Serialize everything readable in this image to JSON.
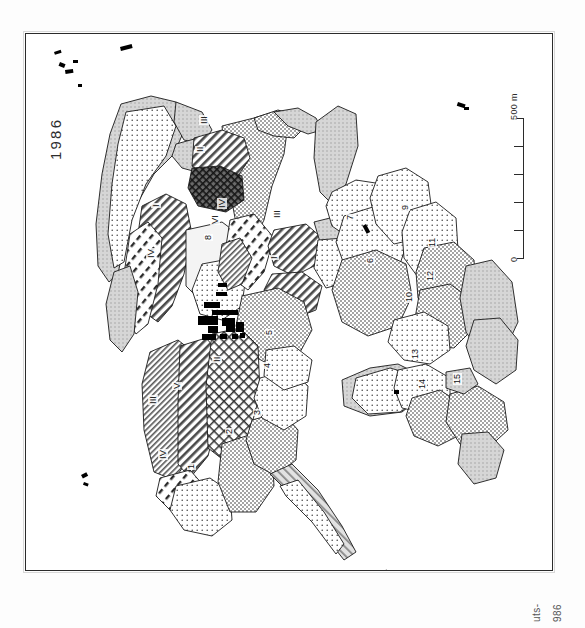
{
  "figure": {
    "year_label": "1986",
    "caption_fragment_1": "uts-",
    "caption_fragment_2": "986",
    "orientation": "rotated-90"
  },
  "scale_bar": {
    "max_label": "500 m",
    "min_label": "0",
    "segments": 5,
    "unit": "m",
    "max_value": 500,
    "min_value": 0
  },
  "colors": {
    "ink": "#111111",
    "frame": "#2b2b2b",
    "paper": "#ffffff",
    "light_tone": "#e9e9e9",
    "mid_tone": "#c9c9c9",
    "dark_tone": "#6f6f6f",
    "building_fill": "#000000"
  },
  "map": {
    "roman_parcels": [
      {
        "label": "III",
        "x": 198,
        "y": 124,
        "pattern": "diagonal-hatch"
      },
      {
        "label": "II",
        "x": 194,
        "y": 152,
        "pattern": "dark-crosshatch"
      },
      {
        "label": "I",
        "x": 150,
        "y": 207,
        "pattern": "diagonal-hatch"
      },
      {
        "label": "IV",
        "x": 145,
        "y": 258,
        "pattern": "dash-hatch"
      },
      {
        "label": "IV",
        "x": 216,
        "y": 208,
        "pattern": "dash-hatch"
      },
      {
        "label": "VI",
        "x": 209,
        "y": 224,
        "pattern": "dash-hatch"
      },
      {
        "label": "III",
        "x": 271,
        "y": 218,
        "pattern": "diagonal-hatch"
      },
      {
        "label": "I",
        "x": 268,
        "y": 259,
        "pattern": "diagonal-hatch"
      },
      {
        "label": "III",
        "x": 147,
        "y": 404,
        "pattern": "diagonal-hatch"
      },
      {
        "label": "V",
        "x": 171,
        "y": 389,
        "pattern": "diagonal-hatch"
      },
      {
        "label": "II",
        "x": 211,
        "y": 362,
        "pattern": "crosshatch"
      },
      {
        "label": "IV",
        "x": 157,
        "y": 459,
        "pattern": "dash-hatch"
      }
    ],
    "numbered_parcels": [
      {
        "label": "1",
        "x": 186,
        "y": 469
      },
      {
        "label": "2",
        "x": 224,
        "y": 434
      },
      {
        "label": "3",
        "x": 252,
        "y": 415
      },
      {
        "label": "4",
        "x": 262,
        "y": 368
      },
      {
        "label": "5",
        "x": 264,
        "y": 335
      },
      {
        "label": "6",
        "x": 365,
        "y": 263
      },
      {
        "label": "7",
        "x": 345,
        "y": 220
      },
      {
        "label": "8",
        "x": 203,
        "y": 240
      },
      {
        "label": "9",
        "x": 400,
        "y": 210
      },
      {
        "label": "10",
        "x": 404,
        "y": 302
      },
      {
        "label": "11",
        "x": 427,
        "y": 247
      },
      {
        "label": "12",
        "x": 425,
        "y": 281
      },
      {
        "label": "13",
        "x": 410,
        "y": 359
      },
      {
        "label": "14",
        "x": 417,
        "y": 389
      },
      {
        "label": "15",
        "x": 452,
        "y": 384
      }
    ],
    "settlement": {
      "name": "village-built-up-area",
      "x": 200,
      "y": 285
    },
    "isolated_buildings": [
      {
        "x": 55,
        "y": 52
      },
      {
        "x": 62,
        "y": 63
      },
      {
        "x": 66,
        "y": 70
      },
      {
        "x": 72,
        "y": 60
      },
      {
        "x": 78,
        "y": 84
      },
      {
        "x": 121,
        "y": 50
      },
      {
        "x": 128,
        "y": 47
      },
      {
        "x": 457,
        "y": 103
      },
      {
        "x": 464,
        "y": 107
      },
      {
        "x": 80,
        "y": 476
      },
      {
        "x": 83,
        "y": 482
      },
      {
        "x": 381,
        "y": 573
      },
      {
        "x": 388,
        "y": 576
      }
    ]
  }
}
